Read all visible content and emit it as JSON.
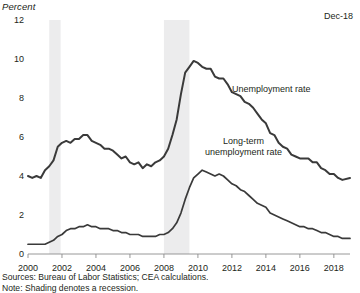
{
  "axis_title": "Percent",
  "date_stamp": "Dec-18",
  "footnotes": {
    "sources": "Sources: Bureau of Labor Statistics; CEA calculations.",
    "note": "Note: Shading denotes a recession."
  },
  "labels": {
    "unemployment": "Unemployment rate",
    "longterm_line1": "Long-term",
    "longterm_line2": "unemployment rate"
  },
  "chart_data": {
    "type": "line",
    "title": "",
    "xlabel": "",
    "ylabel": "Percent",
    "xlim": [
      2000.0,
      2018.95
    ],
    "ylim": [
      0,
      12
    ],
    "yticks": [
      0,
      2,
      4,
      6,
      8,
      12
    ],
    "ytick_labels": [
      "0",
      "2",
      "4",
      "6",
      "8",
      "10",
      "12"
    ],
    "ytick_values": [
      0,
      2,
      4,
      6,
      8,
      10,
      12
    ],
    "xticks": [
      2000,
      2002,
      2004,
      2006,
      2008,
      2010,
      2012,
      2014,
      2016,
      2018
    ],
    "xtick_labels": [
      "2000",
      "2002",
      "2004",
      "2006",
      "2008",
      "2010",
      "2012",
      "2014",
      "2016",
      "2018"
    ],
    "grid": false,
    "legend_position": "inline-annotation",
    "line_color": "#3a3a3a",
    "shading_color": "#ececed",
    "shaded_regions": [
      {
        "label": "2001 recession",
        "x0": 2001.25,
        "x1": 2001.92
      },
      {
        "label": "2008-09 recession",
        "x0": 2008.0,
        "x1": 2009.5
      }
    ],
    "series": [
      {
        "name": "Unemployment rate",
        "x": [
          2000.0,
          2000.25,
          2000.5,
          2000.75,
          2001.0,
          2001.25,
          2001.5,
          2001.75,
          2002.0,
          2002.25,
          2002.5,
          2002.75,
          2003.0,
          2003.25,
          2003.5,
          2003.75,
          2004.0,
          2004.25,
          2004.5,
          2004.75,
          2005.0,
          2005.25,
          2005.5,
          2005.75,
          2006.0,
          2006.25,
          2006.5,
          2006.75,
          2007.0,
          2007.25,
          2007.5,
          2007.75,
          2008.0,
          2008.25,
          2008.5,
          2008.75,
          2009.0,
          2009.25,
          2009.5,
          2009.75,
          2010.0,
          2010.25,
          2010.5,
          2010.75,
          2011.0,
          2011.25,
          2011.5,
          2011.75,
          2012.0,
          2012.25,
          2012.5,
          2012.75,
          2013.0,
          2013.25,
          2013.5,
          2013.75,
          2014.0,
          2014.25,
          2014.5,
          2014.75,
          2015.0,
          2015.25,
          2015.5,
          2015.75,
          2016.0,
          2016.25,
          2016.5,
          2016.75,
          2017.0,
          2017.25,
          2017.5,
          2017.75,
          2018.0,
          2018.25,
          2018.5,
          2018.95
        ],
        "values": [
          4.0,
          3.9,
          4.0,
          3.9,
          4.3,
          4.5,
          4.8,
          5.5,
          5.7,
          5.8,
          5.7,
          5.9,
          5.9,
          6.1,
          6.1,
          5.8,
          5.7,
          5.6,
          5.4,
          5.4,
          5.3,
          5.1,
          4.9,
          5.0,
          4.7,
          4.6,
          4.7,
          4.4,
          4.6,
          4.5,
          4.7,
          4.8,
          5.0,
          5.4,
          6.1,
          6.9,
          8.2,
          9.3,
          9.6,
          9.9,
          9.8,
          9.6,
          9.5,
          9.5,
          9.1,
          9.0,
          9.0,
          8.7,
          8.3,
          8.2,
          8.1,
          7.8,
          7.7,
          7.5,
          7.2,
          6.9,
          6.7,
          6.2,
          6.1,
          5.7,
          5.5,
          5.4,
          5.1,
          5.0,
          4.9,
          4.9,
          4.9,
          4.7,
          4.7,
          4.4,
          4.3,
          4.1,
          4.1,
          3.9,
          3.8,
          3.9
        ]
      },
      {
        "name": "Long-term unemployment rate",
        "x": [
          2000.0,
          2000.25,
          2000.5,
          2000.75,
          2001.0,
          2001.25,
          2001.5,
          2001.75,
          2002.0,
          2002.25,
          2002.5,
          2002.75,
          2003.0,
          2003.25,
          2003.5,
          2003.75,
          2004.0,
          2004.25,
          2004.5,
          2004.75,
          2005.0,
          2005.25,
          2005.5,
          2005.75,
          2006.0,
          2006.25,
          2006.5,
          2006.75,
          2007.0,
          2007.25,
          2007.5,
          2007.75,
          2008.0,
          2008.25,
          2008.5,
          2008.75,
          2009.0,
          2009.25,
          2009.5,
          2009.75,
          2010.0,
          2010.25,
          2010.5,
          2010.75,
          2011.0,
          2011.25,
          2011.5,
          2011.75,
          2012.0,
          2012.25,
          2012.5,
          2012.75,
          2013.0,
          2013.25,
          2013.5,
          2013.75,
          2014.0,
          2014.25,
          2014.5,
          2014.75,
          2015.0,
          2015.25,
          2015.5,
          2015.75,
          2016.0,
          2016.25,
          2016.5,
          2016.75,
          2017.0,
          2017.25,
          2017.5,
          2017.75,
          2018.0,
          2018.25,
          2018.5,
          2018.95
        ],
        "values": [
          0.5,
          0.5,
          0.5,
          0.5,
          0.5,
          0.6,
          0.7,
          0.9,
          1.0,
          1.2,
          1.3,
          1.3,
          1.4,
          1.4,
          1.5,
          1.4,
          1.4,
          1.3,
          1.3,
          1.3,
          1.2,
          1.2,
          1.1,
          1.1,
          1.0,
          1.0,
          1.0,
          0.9,
          0.9,
          0.9,
          0.9,
          1.0,
          1.0,
          1.1,
          1.3,
          1.6,
          2.1,
          2.8,
          3.4,
          3.9,
          4.1,
          4.3,
          4.2,
          4.1,
          4.0,
          4.1,
          4.0,
          3.8,
          3.6,
          3.5,
          3.3,
          3.2,
          3.0,
          2.8,
          2.6,
          2.5,
          2.4,
          2.1,
          2.0,
          1.9,
          1.8,
          1.7,
          1.6,
          1.5,
          1.4,
          1.4,
          1.3,
          1.3,
          1.2,
          1.1,
          1.1,
          1.0,
          0.9,
          0.9,
          0.8,
          0.8
        ]
      }
    ]
  }
}
